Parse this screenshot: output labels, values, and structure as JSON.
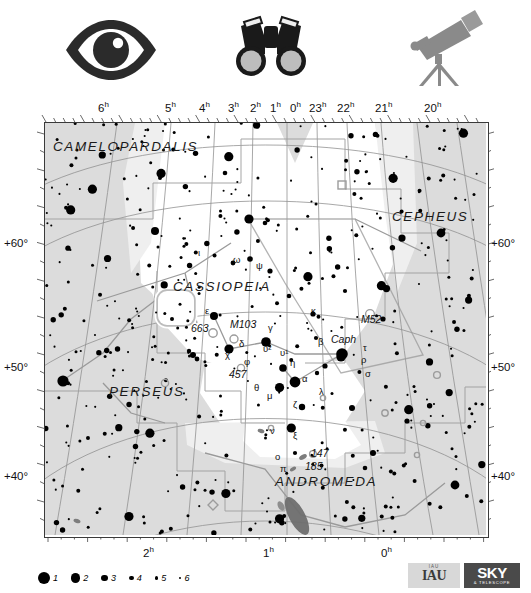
{
  "top_icons": [
    {
      "name": "eye-icon",
      "label": "naked eye"
    },
    {
      "name": "binoculars-icon",
      "label": "binoculars"
    },
    {
      "name": "telescope-icon",
      "label": "telescope"
    }
  ],
  "axes": {
    "ra_top": [
      "6h",
      "5h",
      "4h",
      "3h",
      "2h",
      "1h",
      "0h",
      "23h",
      "22h",
      "21h",
      "20h"
    ],
    "ra_bottom": [
      "2h",
      "1h",
      "0h"
    ],
    "dec_left": [
      "+60°",
      "+50°",
      "+40°"
    ],
    "dec_right": [
      "+60°",
      "+50°",
      "+40°"
    ]
  },
  "constellations": [
    {
      "name": "CAMELOPARDALIS",
      "x": 52,
      "y": 150
    },
    {
      "name": "CASSIOPEIA",
      "x": 172,
      "y": 290
    },
    {
      "name": "CEPHEUS",
      "x": 391,
      "y": 220
    },
    {
      "name": "PERSEUS",
      "x": 108,
      "y": 395
    },
    {
      "name": "ANDROMEDA",
      "x": 274,
      "y": 485
    }
  ],
  "star_labels": [
    {
      "text": "ι",
      "x": 197,
      "y": 255
    },
    {
      "text": "ω",
      "x": 232,
      "y": 262
    },
    {
      "text": "ψ",
      "x": 255,
      "y": 268
    },
    {
      "text": "ε",
      "x": 204,
      "y": 313
    },
    {
      "text": "663",
      "x": 190,
      "y": 331
    },
    {
      "text": "M103",
      "x": 229,
      "y": 327
    },
    {
      "text": "γ",
      "x": 267,
      "y": 330
    },
    {
      "text": "κ",
      "x": 310,
      "y": 313
    },
    {
      "text": "M52",
      "x": 360,
      "y": 322
    },
    {
      "text": "δ",
      "x": 238,
      "y": 346
    },
    {
      "text": "χ",
      "x": 224,
      "y": 357
    },
    {
      "text": "υ²",
      "x": 262,
      "y": 351
    },
    {
      "text": "υ¹",
      "x": 279,
      "y": 355
    },
    {
      "text": "β",
      "x": 317,
      "y": 344
    },
    {
      "text": "Caph",
      "x": 330,
      "y": 342
    },
    {
      "text": "τ",
      "x": 362,
      "y": 350
    },
    {
      "text": "φ",
      "x": 243,
      "y": 364
    },
    {
      "text": "457",
      "x": 228,
      "y": 377
    },
    {
      "text": "η",
      "x": 289,
      "y": 365
    },
    {
      "text": "ρ",
      "x": 360,
      "y": 362
    },
    {
      "text": "α",
      "x": 301,
      "y": 381
    },
    {
      "text": "σ",
      "x": 364,
      "y": 376
    },
    {
      "text": "θ",
      "x": 253,
      "y": 390
    },
    {
      "text": "μ",
      "x": 266,
      "y": 398
    },
    {
      "text": "λ",
      "x": 318,
      "y": 394
    },
    {
      "text": "ζ",
      "x": 292,
      "y": 407
    },
    {
      "text": "ν",
      "x": 269,
      "y": 433
    },
    {
      "text": "ξ",
      "x": 292,
      "y": 438
    },
    {
      "text": "ο",
      "x": 274,
      "y": 459
    },
    {
      "text": "147",
      "x": 310,
      "y": 456
    },
    {
      "text": "π",
      "x": 279,
      "y": 471
    },
    {
      "text": "185",
      "x": 304,
      "y": 469
    }
  ],
  "legend": {
    "magnitudes": [
      {
        "label": "1",
        "radius": 6.0
      },
      {
        "label": "2",
        "radius": 4.6
      },
      {
        "label": "3",
        "radius": 3.4
      },
      {
        "label": "4",
        "radius": 2.4
      },
      {
        "label": "5",
        "radius": 1.7
      },
      {
        "label": "6",
        "radius": 1.1
      }
    ]
  },
  "logos": {
    "iau_top": "IAU",
    "iau": "IAU",
    "sky_main": "SKY",
    "sky_sub": "& TELESCOPE"
  },
  "colors": {
    "background": "#ffffff",
    "sky_fill": "#dcdcdc",
    "milkyway": "#ffffff",
    "grid": "#8f8f8f",
    "border": "#3a3a3a",
    "star": "#000000",
    "text": "#111111",
    "boundary": "#9a9a9a"
  },
  "chart_data": {
    "type": "scatter",
    "title": "Cassiopeia",
    "xlabel": "Right Ascension",
    "ylabel": "Declination",
    "xlim": [
      "6h",
      "20h"
    ],
    "ylim": [
      35,
      70
    ],
    "grid": true,
    "legend_position": "bottom-left",
    "named_stars": [
      {
        "name": "α Cas (Schedar)",
        "mag": 2.2,
        "x": 294,
        "y": 381
      },
      {
        "name": "β Cas (Caph)",
        "mag": 2.3,
        "x": 341,
        "y": 353
      },
      {
        "name": "γ Cas",
        "mag": 2.2,
        "x": 265,
        "y": 341
      },
      {
        "name": "δ Cas (Ruchbah)",
        "mag": 2.7,
        "x": 228,
        "y": 348
      },
      {
        "name": "ε Cas",
        "mag": 3.4,
        "x": 213,
        "y": 315
      },
      {
        "name": "η Cas",
        "mag": 3.4,
        "x": 282,
        "y": 367
      },
      {
        "name": "ζ Cas",
        "mag": 3.7,
        "x": 301,
        "y": 406
      }
    ],
    "deep_sky": [
      {
        "name": "M52",
        "type": "open cluster",
        "x": 369,
        "y": 313
      },
      {
        "name": "M103",
        "type": "open cluster",
        "x": 233,
        "y": 338
      },
      {
        "name": "NGC 663",
        "type": "open cluster",
        "x": 211,
        "y": 332
      },
      {
        "name": "NGC 457",
        "type": "open cluster",
        "x": 238,
        "y": 366
      },
      {
        "name": "NGC 147",
        "type": "galaxy",
        "x": 300,
        "y": 456
      },
      {
        "name": "NGC 185",
        "type": "galaxy",
        "x": 295,
        "y": 468
      },
      {
        "name": "M31",
        "type": "galaxy",
        "x": 296,
        "y": 515
      }
    ]
  }
}
